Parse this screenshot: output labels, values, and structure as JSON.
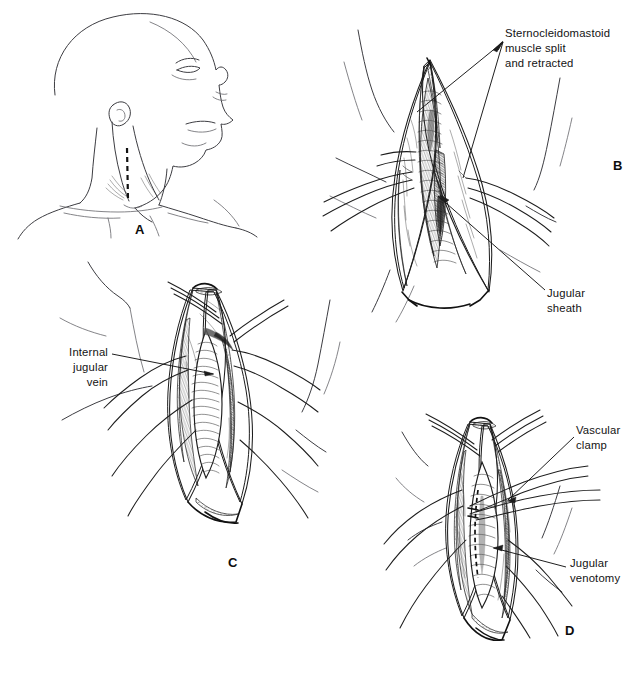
{
  "figure": {
    "kind": "medical-surgical-illustration",
    "technique": "pen-and-ink line drawing",
    "background_color": "#ffffff",
    "ink_color": "#1d1d1d",
    "body_outline_color": "#6e6e72",
    "width": 644,
    "height": 685,
    "panel_count": 4
  },
  "panels": [
    {
      "letter": "A",
      "letter_x": 135,
      "letter_y": 222,
      "description": "Lateral view of head and neck, chin elevated and rotated, with dashed vertical incision line over the sternocleidomastoid"
    },
    {
      "letter": "B",
      "letter_x": 613,
      "letter_y": 158,
      "description": "Lens-shaped open neck wound, sternocleidomastoid muscle split and held by retractors, jugular sheath exposed in the depth"
    },
    {
      "letter": "C",
      "letter_x": 228,
      "letter_y": 555,
      "description": "Deeper exposure with the internal jugular vein dissected free within the wound"
    },
    {
      "letter": "D",
      "letter_x": 565,
      "letter_y": 623,
      "description": "Vascular clamp applied to the jugular vein with dashed venotomy line marked on the vessel wall"
    }
  ],
  "labels": [
    {
      "id": "sternocleidomastoid",
      "text": "Sternocleidomastoid\nmuscle split\nand retracted",
      "align": "left",
      "x": 505,
      "y": 26,
      "panel": "B"
    },
    {
      "id": "jugular-sheath",
      "text": "Jugular\nsheath",
      "align": "left",
      "x": 547,
      "y": 286,
      "panel": "B"
    },
    {
      "id": "internal-jugular-vein",
      "text": "Internal\njugular\nvein",
      "align": "right",
      "x": 34,
      "y": 345,
      "width": 74,
      "panel": "C"
    },
    {
      "id": "vascular-clamp",
      "text": "Vascular\nclamp",
      "align": "left",
      "x": 576,
      "y": 423,
      "panel": "D"
    },
    {
      "id": "jugular-venotomy",
      "text": "Jugular\nvenotomy",
      "align": "left",
      "x": 570,
      "y": 556,
      "panel": "D"
    }
  ]
}
